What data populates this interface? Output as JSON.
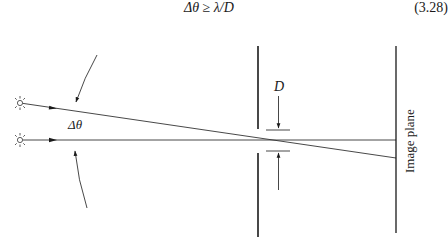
{
  "equation": {
    "lhs": "Δθ",
    "relation": "≥",
    "rhs": "λ/D",
    "number": "(3.28)"
  },
  "diagram": {
    "labels": {
      "angle": "Δθ",
      "aperture": "D",
      "screen": "Image plane"
    },
    "elements": {
      "sources": [
        "point-source-upper",
        "point-source-lower"
      ],
      "rays": [
        "slanted-ray",
        "horizontal-ray"
      ],
      "aperture_stop": "barrier-with-opening",
      "image_plane": "vertical-line"
    },
    "colors": {
      "stroke": "#1a1a1a",
      "ray": "#333333",
      "background": "#ffffff"
    }
  }
}
